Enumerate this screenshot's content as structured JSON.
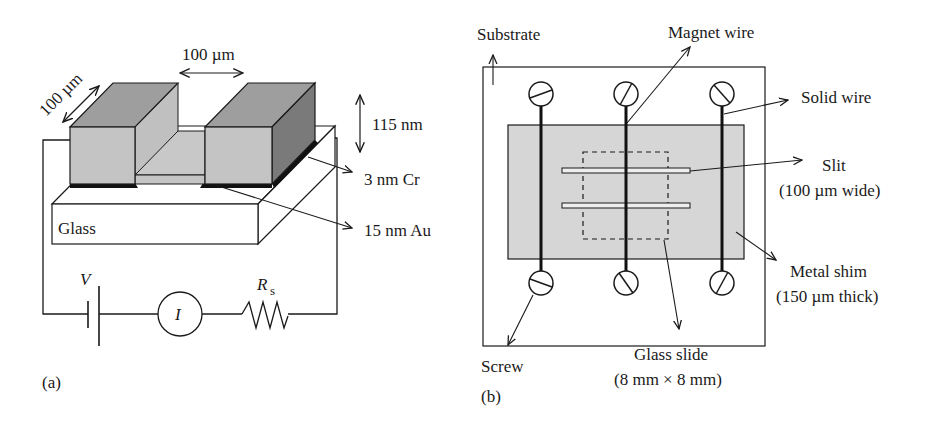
{
  "panel_a": {
    "caption": "(a)",
    "dim_width_label": "100 µm",
    "dim_depth_label": "100 µm",
    "dim_height_label": "115 nm",
    "cr_label": "3 nm Cr",
    "au_label": "15 nm Au",
    "glass_label": "Glass",
    "circuit": {
      "voltage_label": "V",
      "current_label": "I",
      "resistor_label": "R",
      "resistor_subscript": "s"
    }
  },
  "panel_b": {
    "caption": "(b)",
    "substrate_label": "Substrate",
    "magnet_wire_label": "Magnet wire",
    "solid_wire_label": "Solid wire",
    "slit_label": "Slit",
    "slit_sub_label": "(100 µm wide)",
    "metal_shim_label": "Metal shim",
    "metal_shim_sub_label": "(150 µm thick)",
    "screw_label": "Screw",
    "glass_slide_label": "Glass slide",
    "glass_slide_sub_label": "(8 mm × 8 mm)"
  },
  "colors": {
    "block_front": "#c4c4c4",
    "block_top": "#9e9e9e",
    "block_side": "#7a7a7a",
    "shim_fill": "#d6d6d6",
    "line": "#1a1a1a"
  }
}
